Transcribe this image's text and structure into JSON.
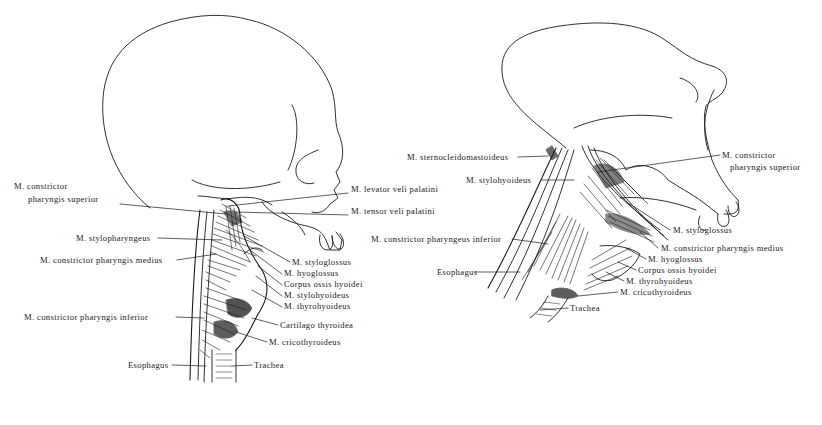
{
  "figure": {
    "ink_color": "#1a1a1a",
    "background": "#ffffff",
    "panels": [
      {
        "id": "human",
        "subject": "human skull and pharyngeal muscles (lateral view)",
        "labels": [
          {
            "text": "M. constrictor",
            "x": 28,
            "y": 186
          },
          {
            "text": "pharyngis superior",
            "x": 28,
            "y": 199
          },
          {
            "text": "M. levator veli palatini",
            "x": 351,
            "y": 189
          },
          {
            "text": "M. tensor veli palatini",
            "x": 351,
            "y": 211
          },
          {
            "text": "M. stylopharyngeus",
            "x": 76,
            "y": 234
          },
          {
            "text": "M. constrictor pharyngis medius",
            "x": 40,
            "y": 256
          },
          {
            "text": "M. styloglossus",
            "x": 292,
            "y": 258
          },
          {
            "text": "M. hyoglossus",
            "x": 284,
            "y": 270
          },
          {
            "text": "Corpus ossis hyoidei",
            "x": 284,
            "y": 281
          },
          {
            "text": "M. stylohyoideus",
            "x": 284,
            "y": 292
          },
          {
            "text": "M. thyrohyoideus",
            "x": 284,
            "y": 303
          },
          {
            "text": "M. constrictor pharyngis inferior",
            "x": 24,
            "y": 313
          },
          {
            "text": "Cartilago thyroidea",
            "x": 280,
            "y": 321
          },
          {
            "text": "M. cricothyroideus",
            "x": 269,
            "y": 338
          },
          {
            "text": "Esophagus",
            "x": 128,
            "y": 361
          },
          {
            "text": "Trachea",
            "x": 254,
            "y": 361
          }
        ]
      },
      {
        "id": "chimpanzee",
        "subject": "ape skull and pharyngeal muscles (lateral view)",
        "labels": [
          {
            "text": "M. sternocleidomastoideus",
            "x": 407,
            "y": 153
          },
          {
            "text": "M. constrictor",
            "x": 722,
            "y": 151
          },
          {
            "text": "pharyngis superior",
            "x": 722,
            "y": 163
          },
          {
            "text": "M. stylohyoideus",
            "x": 466,
            "y": 176
          },
          {
            "text": "M. constrictor pharyngeus inferior",
            "x": 371,
            "y": 235
          },
          {
            "text": "M. styloglossus",
            "x": 673,
            "y": 226
          },
          {
            "text": "M. constrictor pharyngis medius",
            "x": 661,
            "y": 244
          },
          {
            "text": "M. hyoglossus",
            "x": 648,
            "y": 255
          },
          {
            "text": "Corpus ossis hyoidei",
            "x": 638,
            "y": 266
          },
          {
            "text": "Esophagus",
            "x": 437,
            "y": 268
          },
          {
            "text": "M. thyrohyoideus",
            "x": 626,
            "y": 277
          },
          {
            "text": "M. cricothyroideus",
            "x": 620,
            "y": 288
          },
          {
            "text": "Trachea",
            "x": 570,
            "y": 304
          }
        ]
      }
    ]
  }
}
